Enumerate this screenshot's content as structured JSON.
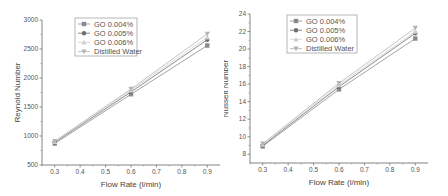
{
  "chart_data": [
    {
      "type": "line",
      "title": "",
      "xlabel": "Flow Rate (l/min)",
      "ylabel": "Reynold Number",
      "xlim": [
        0.25,
        0.95
      ],
      "ylim": [
        500,
        3000
      ],
      "xticks": [
        "0.3",
        "0.4",
        "0.5",
        "0.6",
        "0.7",
        "0.8",
        "0.9"
      ],
      "yticks": [
        "500",
        "1000",
        "1500",
        "2000",
        "2500",
        "3000"
      ],
      "grid": false,
      "legend_position": "upper-left",
      "x": [
        0.3,
        0.6,
        0.9
      ],
      "series": [
        {
          "name": "GO 0.004%",
          "values": [
            870,
            1720,
            2560
          ],
          "color": "#8a8a8a",
          "marker": "square"
        },
        {
          "name": "GO 0.005%",
          "values": [
            890,
            1760,
            2660
          ],
          "color": "#6e6e6e",
          "marker": "circle"
        },
        {
          "name": "GO 0.006%",
          "values": [
            900,
            1790,
            2700
          ],
          "color": "#d0d0d0",
          "marker": "triangle-up"
        },
        {
          "name": "Distilled Water",
          "values": [
            910,
            1810,
            2760
          ],
          "color": "#b4b4b4",
          "marker": "triangle-down"
        }
      ]
    },
    {
      "type": "line",
      "title": "",
      "xlabel": "Flow Rate (l/min)",
      "ylabel": "Nusselt Number",
      "xlim": [
        0.25,
        0.95
      ],
      "ylim": [
        7,
        24
      ],
      "xticks": [
        "0.3",
        "0.4",
        "0.5",
        "0.6",
        "0.7",
        "0.8",
        "0.9"
      ],
      "yticks": [
        "8",
        "10",
        "12",
        "14",
        "16",
        "18",
        "20",
        "22",
        "24"
      ],
      "grid": false,
      "legend_position": "upper-left",
      "x": [
        0.3,
        0.6,
        0.9
      ],
      "series": [
        {
          "name": "GO 0.004%",
          "values": [
            8.9,
            15.4,
            21.2
          ],
          "color": "#8a8a8a",
          "marker": "square"
        },
        {
          "name": "GO 0.005%",
          "values": [
            9.0,
            15.7,
            21.8
          ],
          "color": "#6e6e6e",
          "marker": "circle"
        },
        {
          "name": "GO 0.006%",
          "values": [
            9.1,
            15.9,
            22.0
          ],
          "color": "#d0d0d0",
          "marker": "triangle-up"
        },
        {
          "name": "Distilled Water",
          "values": [
            9.2,
            16.1,
            22.4
          ],
          "color": "#b4b4b4",
          "marker": "triangle-down"
        }
      ]
    }
  ],
  "charts": {
    "left": {
      "ylabel": "Reynold Number",
      "xlabel": "Flow Rate (l/min)",
      "legend": [
        "GO 0.004%",
        "GO 0.005%",
        "GO 0.006%",
        "Distilled Water"
      ]
    },
    "right": {
      "ylabel": "Nusselt Number",
      "xlabel": "Flow Rate (l/min)",
      "legend": [
        "GO 0.004%",
        "GO 0.005%",
        "GO 0.006%",
        "Distilled Water"
      ]
    }
  }
}
